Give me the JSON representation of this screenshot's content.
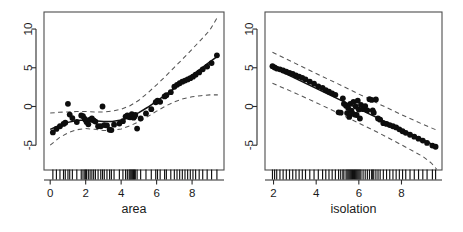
{
  "figure": {
    "type": "multi-panel-scatter-smooth",
    "panel_count": 2,
    "background": "#ffffff",
    "point_color": "#0d0d0d",
    "fit_color": "#111111",
    "band_color": "#555555"
  },
  "chart_data": [
    {
      "type": "scatter",
      "title": "",
      "xlabel": "area",
      "ylabel": "",
      "xlim": [
        -0.35,
        9.8
      ],
      "ylim": [
        -8.2,
        12.2
      ],
      "xticks": [
        0,
        2,
        4,
        6,
        8
      ],
      "yticks": [
        -5,
        0,
        5,
        10
      ],
      "xticklabels": [
        "0",
        "2",
        "4",
        "6",
        "8"
      ],
      "yticklabels": [
        "-5",
        "0",
        "5",
        "10"
      ],
      "grid": false,
      "legend": null,
      "series": [
        {
          "name": "partial residuals",
          "type": "scatter",
          "x": [
            0.15,
            0.35,
            0.55,
            0.75,
            0.85,
            1.0,
            1.1,
            1.25,
            1.5,
            1.75,
            1.85,
            1.95,
            2.0,
            2.05,
            2.15,
            2.25,
            2.35,
            2.45,
            2.55,
            2.7,
            2.85,
            2.95,
            3.05,
            3.2,
            3.35,
            3.45,
            3.6,
            3.9,
            4.1,
            4.25,
            4.35,
            4.45,
            4.5,
            4.55,
            4.6,
            4.65,
            4.7,
            4.75,
            4.8,
            4.9,
            5.1,
            5.4,
            5.7,
            5.95,
            6.05,
            6.2,
            6.45,
            6.55,
            6.8,
            7.0,
            7.15,
            7.3,
            7.45,
            7.6,
            7.75,
            7.9,
            8.05,
            8.2,
            8.4,
            8.6,
            8.85,
            9.1,
            9.4
          ],
          "y": [
            -3.35,
            -2.9,
            -2.55,
            -2.25,
            -2.1,
            0.35,
            -1.05,
            -1.5,
            -2.0,
            -1.15,
            -1.25,
            -1.6,
            -1.75,
            -2.0,
            -2.3,
            -1.7,
            -1.55,
            -1.8,
            -1.95,
            -2.55,
            -2.55,
            0.0,
            -2.4,
            -2.45,
            -3.0,
            -3.05,
            -2.35,
            -2.2,
            -1.9,
            -1.3,
            -1.15,
            -1.35,
            -1.4,
            -1.2,
            -1.0,
            -1.25,
            -1.45,
            -1.3,
            -1.1,
            -2.85,
            -1.55,
            -0.9,
            -0.35,
            0.55,
            0.75,
            0.6,
            1.3,
            1.45,
            1.85,
            2.55,
            2.8,
            3.0,
            3.2,
            3.35,
            3.5,
            3.65,
            3.85,
            4.1,
            4.4,
            4.8,
            5.15,
            5.6,
            6.6
          ]
        },
        {
          "name": "smooth fit",
          "type": "line",
          "x": [
            0.0,
            0.5,
            1.0,
            1.5,
            2.0,
            2.5,
            3.0,
            3.5,
            4.0,
            4.5,
            5.0,
            5.5,
            6.0,
            6.5,
            7.0,
            7.5,
            8.0,
            8.5,
            9.0,
            9.45
          ],
          "y": [
            -2.95,
            -2.45,
            -2.05,
            -1.8,
            -1.75,
            -1.85,
            -1.95,
            -1.95,
            -1.75,
            -1.35,
            -0.8,
            -0.1,
            0.7,
            1.5,
            2.35,
            3.2,
            4.05,
            4.9,
            5.75,
            6.5
          ]
        },
        {
          "name": "upper confidence band",
          "type": "line",
          "style": "dashed",
          "x": [
            0.0,
            0.5,
            1.0,
            1.5,
            2.0,
            2.5,
            3.0,
            3.5,
            4.0,
            4.5,
            5.0,
            5.5,
            6.0,
            6.5,
            7.0,
            7.5,
            8.0,
            8.5,
            9.0,
            9.45
          ],
          "y": [
            -0.85,
            -0.75,
            -0.7,
            -0.65,
            -0.65,
            -0.7,
            -0.7,
            -0.6,
            -0.35,
            0.1,
            0.8,
            1.75,
            2.8,
            3.9,
            5.05,
            6.2,
            7.4,
            8.6,
            9.85,
            11.6
          ]
        },
        {
          "name": "lower confidence band",
          "type": "line",
          "style": "dashed",
          "x": [
            0.0,
            0.5,
            1.0,
            1.5,
            2.0,
            2.5,
            3.0,
            3.5,
            4.0,
            4.5,
            5.0,
            5.5,
            6.0,
            6.5,
            7.0,
            7.5,
            8.0,
            8.5,
            9.0,
            9.45
          ],
          "y": [
            -5.0,
            -4.05,
            -3.4,
            -3.0,
            -2.85,
            -2.95,
            -3.1,
            -3.1,
            -2.9,
            -2.5,
            -1.95,
            -1.3,
            -0.6,
            0.05,
            0.6,
            1.0,
            1.25,
            1.4,
            1.5,
            1.5
          ]
        }
      ],
      "rug": [
        0.15,
        0.35,
        0.55,
        0.75,
        0.85,
        1.0,
        1.1,
        1.25,
        1.5,
        1.75,
        1.85,
        1.95,
        2.0,
        2.05,
        2.15,
        2.25,
        2.35,
        2.45,
        2.55,
        2.7,
        2.85,
        2.95,
        3.05,
        3.2,
        3.35,
        3.45,
        3.6,
        3.9,
        4.1,
        4.25,
        4.35,
        4.45,
        4.5,
        4.55,
        4.6,
        4.65,
        4.7,
        4.75,
        4.8,
        4.9,
        5.1,
        5.4,
        5.7,
        5.95,
        6.05,
        6.2,
        6.45,
        6.55,
        6.8,
        7.0,
        7.15,
        7.3,
        7.45,
        7.6,
        7.75,
        7.9,
        8.05,
        8.2,
        8.4,
        8.6,
        8.85,
        9.1,
        9.4
      ]
    },
    {
      "type": "scatter",
      "title": "",
      "xlabel": "isolation",
      "ylabel": "",
      "xlim": [
        1.6,
        9.9
      ],
      "ylim": [
        -8.2,
        12.2
      ],
      "xticks": [
        2,
        4,
        6,
        8
      ],
      "yticks": [
        -5,
        0,
        5,
        10
      ],
      "xticklabels": [
        "2",
        "4",
        "6",
        "8"
      ],
      "yticklabels": [
        "-5",
        "0",
        "5",
        "10"
      ],
      "grid": false,
      "legend": null,
      "series": [
        {
          "name": "partial residuals",
          "type": "scatter",
          "x": [
            1.95,
            2.05,
            2.15,
            2.3,
            2.45,
            2.6,
            2.75,
            2.9,
            3.05,
            3.2,
            3.35,
            3.5,
            3.7,
            3.9,
            4.1,
            4.3,
            4.45,
            4.6,
            4.75,
            4.9,
            5.05,
            5.15,
            5.25,
            5.3,
            5.4,
            5.45,
            5.5,
            5.55,
            5.6,
            5.65,
            5.7,
            5.75,
            5.8,
            5.85,
            5.9,
            5.95,
            6.0,
            6.05,
            6.1,
            6.2,
            6.3,
            6.4,
            6.5,
            6.6,
            6.65,
            6.7,
            6.8,
            6.9,
            7.0,
            7.15,
            7.3,
            7.45,
            7.6,
            7.75,
            7.9,
            8.05,
            8.2,
            8.4,
            8.6,
            8.8,
            9.0,
            9.2,
            9.45,
            9.6
          ],
          "y": [
            5.2,
            5.05,
            4.9,
            4.8,
            4.65,
            4.5,
            4.35,
            4.2,
            4.0,
            3.85,
            3.7,
            3.5,
            3.2,
            2.95,
            2.6,
            2.4,
            2.1,
            1.9,
            1.7,
            1.5,
            -0.75,
            -0.8,
            1.05,
            0.35,
            0.1,
            -0.85,
            -0.2,
            -1.35,
            0.35,
            -0.55,
            -0.9,
            0.6,
            -1.05,
            0.0,
            -1.1,
            0.75,
            -0.4,
            -1.55,
            0.2,
            -0.35,
            0.05,
            -0.5,
            0.95,
            0.85,
            -0.5,
            -0.8,
            0.9,
            -1.55,
            -1.7,
            -2.15,
            -2.25,
            -2.4,
            -2.55,
            -2.7,
            -2.95,
            -3.2,
            -3.4,
            -3.65,
            -3.9,
            -4.15,
            -4.4,
            -4.7,
            -5.05,
            -5.2
          ]
        },
        {
          "name": "linear fit",
          "type": "line",
          "x": [
            1.95,
            9.65
          ],
          "y": [
            5.05,
            -5.15
          ]
        },
        {
          "name": "upper confidence band",
          "type": "line",
          "style": "dashed",
          "x": [
            1.95,
            3.0,
            4.0,
            5.0,
            6.0,
            7.0,
            8.0,
            9.0,
            9.65
          ],
          "y": [
            7.0,
            5.6,
            4.25,
            2.95,
            1.6,
            0.25,
            -1.05,
            -2.3,
            -3.05
          ]
        },
        {
          "name": "lower confidence band",
          "type": "line",
          "style": "dashed",
          "x": [
            1.95,
            3.0,
            4.0,
            5.0,
            6.0,
            7.0,
            8.0,
            9.0,
            9.4,
            9.65
          ],
          "y": [
            3.0,
            1.75,
            0.5,
            -0.8,
            -2.15,
            -3.5,
            -4.95,
            -6.45,
            -7.3,
            -8.1
          ]
        }
      ],
      "rug": [
        1.95,
        2.05,
        2.15,
        2.3,
        2.45,
        2.6,
        2.75,
        2.9,
        3.05,
        3.2,
        3.35,
        3.5,
        3.7,
        3.9,
        4.1,
        4.3,
        4.45,
        4.6,
        4.75,
        4.9,
        5.05,
        5.15,
        5.25,
        5.3,
        5.4,
        5.45,
        5.5,
        5.55,
        5.6,
        5.65,
        5.7,
        5.75,
        5.8,
        5.85,
        5.9,
        5.95,
        6.0,
        6.05,
        6.1,
        6.2,
        6.3,
        6.4,
        6.5,
        6.6,
        6.65,
        6.7,
        6.8,
        6.9,
        7.0,
        7.15,
        7.3,
        7.45,
        7.6,
        7.75,
        7.9,
        8.05,
        8.2,
        8.4,
        8.6,
        8.8,
        9.0,
        9.2,
        9.45,
        9.6
      ]
    }
  ]
}
